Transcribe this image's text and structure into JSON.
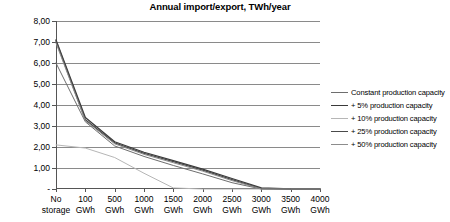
{
  "chart_data": {
    "type": "line",
    "title": "Annual import/export, TWh/year",
    "xlabel": "",
    "ylabel": "",
    "ylim": [
      0,
      8
    ],
    "ytick_labels": [
      "8,00",
      "7,00",
      "6,00",
      "5,00",
      "4,00",
      "3,00",
      "2,00",
      "1,00",
      "-"
    ],
    "ytick_values": [
      8,
      7,
      6,
      5,
      4,
      3,
      2,
      1,
      0
    ],
    "grid": true,
    "legend_position": "right",
    "categories": [
      "No\nstorage",
      "100\nGWh",
      "500\nGWh",
      "1000\nGWh",
      "1500\nGWh",
      "2000\nGWh",
      "2500\nGWh",
      "3000\nGWh",
      "3500\nGWh",
      "4000\nGWh"
    ],
    "series": [
      {
        "name": "Constant production capacity",
        "color": "#6e6e6e",
        "width": 1.0,
        "values": [
          6.0,
          3.2,
          2.05,
          1.55,
          1.12,
          0.72,
          0.3,
          0.0,
          0.0,
          0.0
        ]
      },
      {
        "name": "+ 5% production capacity",
        "color": "#3a3a3a",
        "width": 1.3,
        "values": [
          7.1,
          3.4,
          2.25,
          1.75,
          1.35,
          0.95,
          0.5,
          0.05,
          0.0,
          0.0
        ]
      },
      {
        "name": "+ 10% production capacity",
        "color": "#b6b6b6",
        "width": 1.0,
        "values": [
          2.1,
          1.95,
          1.5,
          0.75,
          0.05,
          0.0,
          0.0,
          0.0,
          0.0,
          0.0
        ]
      },
      {
        "name": "+ 25% production capacity",
        "color": "#4a4a4a",
        "width": 1.3,
        "values": [
          7.05,
          3.3,
          2.2,
          1.7,
          1.3,
          0.9,
          0.45,
          0.02,
          0.0,
          0.0
        ]
      },
      {
        "name": "+ 50% production capacity",
        "color": "#8c8c8c",
        "width": 1.0,
        "values": [
          6.95,
          3.25,
          2.15,
          1.65,
          1.25,
          0.85,
          0.4,
          0.0,
          0.0,
          0.0
        ]
      }
    ]
  },
  "legend": {
    "items": [
      {
        "label": "Constant production capacity"
      },
      {
        "label": "+ 5% production capacity"
      },
      {
        "label": "+ 10% production capacity"
      },
      {
        "label": "+ 25% production capacity"
      },
      {
        "label": "+ 50% production capacity"
      }
    ]
  }
}
